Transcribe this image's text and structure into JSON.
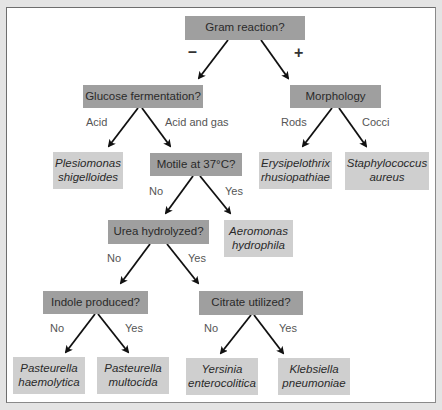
{
  "diagram": {
    "type": "dichotomous identification key",
    "colors": {
      "background": "#e4e4e4",
      "panel": "#ffffff",
      "question_box": "#9f9f9f",
      "result_box": "#cfcfcf",
      "arrow": "#111111",
      "branch_label": "#555555"
    },
    "questions": {
      "gram": "Gram reaction?",
      "glucose": "Glucose fermentation?",
      "morphology": "Morphology",
      "motile": "Motile at 37°C?",
      "urea": "Urea hydrolyzed?",
      "indole": "Indole produced?",
      "citrate": "Citrate utilized?"
    },
    "branches": {
      "gram_neg": "–",
      "gram_pos": "+",
      "glucose_acid": "Acid",
      "glucose_acid_gas": "Acid and gas",
      "morph_rods": "Rods",
      "morph_cocci": "Cocci",
      "motile_no": "No",
      "motile_yes": "Yes",
      "urea_no": "No",
      "urea_yes": "Yes",
      "indole_no": "No",
      "indole_yes": "Yes",
      "citrate_no": "No",
      "citrate_yes": "Yes"
    },
    "results": {
      "plesiomonas": {
        "line1": "Plesiomonas",
        "line2": "shigelloides"
      },
      "erysipelothrix": {
        "line1": "Erysipelothrix",
        "line2": "rhusiopathiae"
      },
      "staphylococcus": {
        "line1": "Staphylococcus",
        "line2": "aureus"
      },
      "aeromonas": {
        "line1": "Aeromonas",
        "line2": "hydrophila"
      },
      "p_haemolytica": {
        "line1": "Pasteurella",
        "line2": "haemolytica"
      },
      "p_multocida": {
        "line1": "Pasteurella",
        "line2": "multocida"
      },
      "yersinia": {
        "line1": "Yersinia",
        "line2": "enterocolitica"
      },
      "klebsiella": {
        "line1": "Klebsiella",
        "line2": "pneumoniae"
      }
    },
    "edges": [
      {
        "from": "gram",
        "to": "glucose",
        "label": "–"
      },
      {
        "from": "gram",
        "to": "morphology",
        "label": "+"
      },
      {
        "from": "glucose",
        "to": "plesiomonas",
        "label": "Acid"
      },
      {
        "from": "glucose",
        "to": "motile",
        "label": "Acid and gas"
      },
      {
        "from": "morphology",
        "to": "erysipelothrix",
        "label": "Rods"
      },
      {
        "from": "morphology",
        "to": "staphylococcus",
        "label": "Cocci"
      },
      {
        "from": "motile",
        "to": "urea",
        "label": "No"
      },
      {
        "from": "motile",
        "to": "aeromonas",
        "label": "Yes"
      },
      {
        "from": "urea",
        "to": "indole",
        "label": "No"
      },
      {
        "from": "urea",
        "to": "citrate",
        "label": "Yes"
      },
      {
        "from": "indole",
        "to": "p_haemolytica",
        "label": "No"
      },
      {
        "from": "indole",
        "to": "p_multocida",
        "label": "Yes"
      },
      {
        "from": "citrate",
        "to": "yersinia",
        "label": "No"
      },
      {
        "from": "citrate",
        "to": "klebsiella",
        "label": "Yes"
      }
    ]
  }
}
